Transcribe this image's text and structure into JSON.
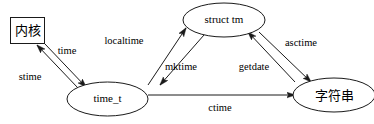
{
  "diagram": {
    "stroke_color": "#1a1a1a",
    "text_color": "#000000",
    "background_color": "#ffffff",
    "nodes": [
      {
        "id": "kernel",
        "label": "内核",
        "shape": "rect",
        "script": "cjk",
        "cx": 27.5,
        "cy": 30.5,
        "w": 34,
        "h": 26
      },
      {
        "id": "struct_tm",
        "label": "struct tm",
        "shape": "ellipse",
        "script": "latin",
        "cx": 224,
        "cy": 20,
        "rx": 41,
        "ry": 17
      },
      {
        "id": "time_t",
        "label": "time_t",
        "shape": "ellipse",
        "script": "latin",
        "cx": 107.5,
        "cy": 99,
        "rx": 40.5,
        "ry": 17
      },
      {
        "id": "string",
        "label": "字符串",
        "shape": "ellipse",
        "script": "cjk",
        "cx": 334,
        "cy": 95,
        "rx": 41,
        "ry": 17
      }
    ],
    "edges": [
      {
        "id": "stime",
        "label": "stime",
        "from": "time_t",
        "to": "kernel",
        "label_x": 30,
        "label_y": 78
      },
      {
        "id": "time",
        "label": "time",
        "from": "kernel",
        "to": "time_t",
        "label_x": 67,
        "label_y": 52
      },
      {
        "id": "localtime",
        "label": "localtime",
        "from": "time_t",
        "to": "struct_tm",
        "label_x": 124,
        "label_y": 42
      },
      {
        "id": "mktime",
        "label": "mktime",
        "from": "struct_tm",
        "to": "time_t",
        "label_x": 181,
        "label_y": 68
      },
      {
        "id": "getdate",
        "label": "getdate",
        "from": "string",
        "to": "struct_tm",
        "label_x": 254,
        "label_y": 68
      },
      {
        "id": "asctime",
        "label": "asctime",
        "from": "struct_tm",
        "to": "string",
        "label_x": 301,
        "label_y": 44
      },
      {
        "id": "ctime",
        "label": "ctime",
        "from": "time_t",
        "to": "string",
        "label_x": 220,
        "label_y": 109
      }
    ]
  }
}
